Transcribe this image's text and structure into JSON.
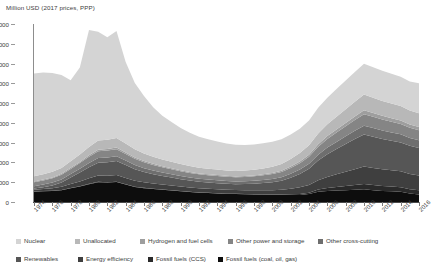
{
  "chart_data": {
    "type": "area",
    "title": "",
    "subtitle": "",
    "ylabel": "Million USD (2017 prices, PPP)",
    "xlabel": "",
    "ylim": [
      0,
      9000
    ],
    "ytick_step": 1000,
    "yticks": [
      0,
      1000,
      2000,
      3000,
      4000,
      5000,
      6000,
      7000,
      8000,
      9000
    ],
    "grid": false,
    "legend_position": "bottom",
    "stacked": true,
    "stack_order_bottom_to_top": [
      "Fossil fuels (coal, oil, gas)",
      "Fossil fuels (CCS)",
      "Energy efficiency",
      "Renewables",
      "Other cross-cutting",
      "Other power and storage",
      "Hydrogen and fuel cells",
      "Unallocated",
      "Nuclear"
    ],
    "x": [
      1974,
      1975,
      1976,
      1977,
      1978,
      1979,
      1980,
      1981,
      1982,
      1983,
      1984,
      1985,
      1986,
      1987,
      1988,
      1989,
      1990,
      1991,
      1992,
      1993,
      1994,
      1995,
      1996,
      1997,
      1998,
      1999,
      2000,
      2001,
      2002,
      2003,
      2004,
      2005,
      2006,
      2007,
      2008,
      2009,
      2010,
      2011,
      2012,
      2013,
      2014,
      2015,
      2016
    ],
    "xtick_labels": [
      1974,
      1976,
      1978,
      1980,
      1982,
      1984,
      1986,
      1988,
      1990,
      1992,
      1994,
      1996,
      1998,
      2000,
      2002,
      2004,
      2006,
      2008,
      2010,
      2012,
      2014,
      2016
    ],
    "series": [
      {
        "name": "Fossil fuels (coal, oil, gas)",
        "color": "#0d0d0d",
        "values": [
          520,
          540,
          560,
          600,
          700,
          780,
          900,
          1000,
          980,
          1010,
          880,
          760,
          700,
          660,
          620,
          580,
          540,
          500,
          470,
          450,
          430,
          410,
          400,
          390,
          380,
          370,
          360,
          350,
          355,
          360,
          400,
          520,
          560,
          580,
          600,
          620,
          640,
          600,
          560,
          540,
          520,
          430,
          380
        ]
      },
      {
        "name": "Fossil fuels (CCS)",
        "color": "#2a2a2a",
        "values": [
          10,
          10,
          10,
          12,
          14,
          16,
          18,
          20,
          20,
          20,
          18,
          16,
          15,
          14,
          14,
          13,
          12,
          12,
          12,
          12,
          12,
          12,
          12,
          14,
          16,
          18,
          20,
          25,
          35,
          50,
          70,
          110,
          150,
          180,
          210,
          240,
          270,
          260,
          250,
          240,
          230,
          220,
          210
        ]
      },
      {
        "name": "Energy efficiency",
        "color": "#3f3f3f",
        "values": [
          90,
          110,
          130,
          160,
          200,
          240,
          280,
          320,
          330,
          340,
          320,
          300,
          280,
          260,
          250,
          240,
          230,
          220,
          210,
          205,
          200,
          195,
          190,
          195,
          200,
          210,
          220,
          240,
          280,
          330,
          390,
          470,
          560,
          640,
          720,
          800,
          880,
          860,
          840,
          820,
          800,
          770,
          750
        ]
      },
      {
        "name": "Renewables",
        "color": "#565656",
        "values": [
          60,
          90,
          140,
          220,
          330,
          450,
          560,
          650,
          680,
          700,
          650,
          580,
          520,
          470,
          430,
          400,
          370,
          350,
          330,
          320,
          310,
          305,
          300,
          310,
          330,
          360,
          400,
          460,
          560,
          680,
          820,
          1000,
          1150,
          1280,
          1400,
          1520,
          1620,
          1580,
          1540,
          1500,
          1460,
          1420,
          1390
        ]
      },
      {
        "name": "Other cross-cutting",
        "color": "#6e6e6e",
        "values": [
          120,
          130,
          140,
          150,
          170,
          190,
          210,
          230,
          235,
          240,
          225,
          210,
          195,
          185,
          175,
          168,
          160,
          155,
          150,
          148,
          145,
          143,
          140,
          145,
          150,
          158,
          168,
          180,
          200,
          225,
          255,
          295,
          330,
          360,
          390,
          420,
          450,
          440,
          430,
          420,
          410,
          400,
          395
        ]
      },
      {
        "name": "Other power and storage",
        "color": "#858585",
        "values": [
          200,
          210,
          220,
          235,
          260,
          290,
          320,
          350,
          355,
          360,
          340,
          315,
          295,
          280,
          265,
          255,
          245,
          235,
          228,
          222,
          218,
          214,
          210,
          215,
          222,
          232,
          245,
          262,
          288,
          318,
          352,
          400,
          440,
          475,
          510,
          545,
          580,
          565,
          550,
          540,
          530,
          515,
          505
        ]
      },
      {
        "name": "Hydrogen and fuel cells",
        "color": "#9e9e9e",
        "values": [
          40,
          42,
          45,
          48,
          55,
          62,
          70,
          78,
          80,
          82,
          76,
          70,
          64,
          60,
          56,
          53,
          50,
          48,
          46,
          45,
          44,
          43,
          42,
          44,
          47,
          51,
          56,
          63,
          74,
          88,
          104,
          125,
          142,
          156,
          170,
          184,
          198,
          192,
          186,
          180,
          174,
          168,
          164
        ]
      },
      {
        "name": "Unallocated",
        "color": "#b8b8b8",
        "values": [
          260,
          270,
          280,
          300,
          330,
          370,
          420,
          460,
          470,
          480,
          450,
          415,
          385,
          365,
          345,
          330,
          315,
          302,
          292,
          285,
          278,
          272,
          268,
          275,
          285,
          300,
          318,
          342,
          380,
          424,
          474,
          540,
          595,
          645,
          695,
          745,
          795,
          775,
          755,
          740,
          725,
          705,
          690
        ]
      },
      {
        "name": "Nuclear",
        "color": "#d4d4d4",
        "values": [
          5200,
          5150,
          5000,
          4700,
          4100,
          4400,
          5920,
          5500,
          5180,
          5420,
          4120,
          3350,
          2900,
          2500,
          2200,
          2000,
          1820,
          1680,
          1560,
          1480,
          1420,
          1370,
          1330,
          1300,
          1280,
          1270,
          1260,
          1250,
          1240,
          1230,
          1250,
          1300,
          1350,
          1400,
          1450,
          1500,
          1560,
          1540,
          1520,
          1500,
          1480,
          1460,
          1520
        ]
      }
    ],
    "totals_note": "stacked totals peak ~8700 in 1980 and ~8250 in 1983; trough ~2700 around 1996-2000; ~5500 in 2010; ~6200 in 2016"
  },
  "legend": {
    "row1": [
      {
        "label": "Nuclear",
        "color": "#d4d4d4"
      },
      {
        "label": "Unallocated",
        "color": "#b8b8b8"
      },
      {
        "label": "Hydrogen and fuel cells",
        "color": "#9e9e9e"
      },
      {
        "label": "Other power and storage",
        "color": "#858585"
      },
      {
        "label": "Other cross-cutting",
        "color": "#6e6e6e"
      }
    ],
    "row2": [
      {
        "label": "Renewables",
        "color": "#565656"
      },
      {
        "label": "Energy efficiency",
        "color": "#3f3f3f"
      },
      {
        "label": "Fossil fuels (CCS)",
        "color": "#2a2a2a"
      },
      {
        "label": "Fossil fuels (coal, oil, gas)",
        "color": "#0d0d0d"
      }
    ]
  }
}
